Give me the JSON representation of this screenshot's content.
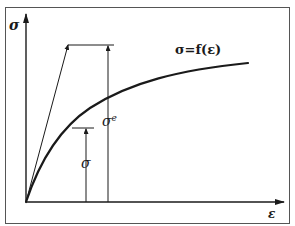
{
  "diagram": {
    "type": "stress-strain curve",
    "y_axis_label": "σ",
    "x_axis_label": "ε",
    "curve_label": "σ=f(ε)",
    "elastic_stress_label": "σ",
    "elastic_stress_superscript": "e",
    "actual_stress_label": "σ",
    "colors": {
      "ink": "#1a1a1a",
      "background": "#ffffff",
      "frame": "#555555"
    }
  }
}
